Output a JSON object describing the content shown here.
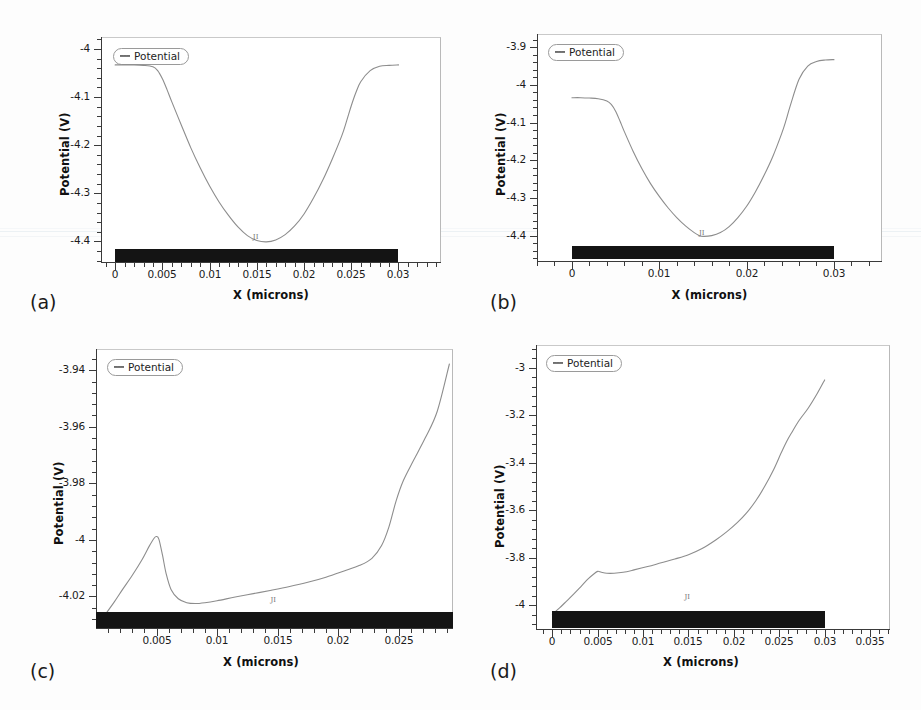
{
  "figure": {
    "background": "#fdfdfd",
    "curve_color": "#8d8d8d",
    "axis_color": "#3a3a3a",
    "device_bar_color": "#141414",
    "panel_count": 4
  },
  "panels": [
    {
      "caption": "(a)",
      "legend_label": "Potential",
      "xlabel": "X (microns)",
      "ylabel": "Potential (V)",
      "micromark": "JI",
      "x_ticks": [
        "0",
        "0.005",
        "0.01",
        "0.015",
        "0.02",
        "0.025",
        "0.03"
      ],
      "y_ticks": [
        "-4",
        "-4.1",
        "-4.2",
        "-4.3",
        "-4.4"
      ]
    },
    {
      "caption": "(b)",
      "legend_label": "Potential",
      "xlabel": "X (microns)",
      "ylabel": "Potential (V)",
      "micromark": "JI",
      "x_ticks": [
        "0",
        "0.01",
        "0.02",
        "0.03"
      ],
      "y_ticks": [
        "-3.9",
        "-4",
        "-4.1",
        "-4.2",
        "-4.3",
        "-4.4"
      ]
    },
    {
      "caption": "(c)",
      "legend_label": "Potential",
      "xlabel": "X (microns)",
      "ylabel": "Potential (V)",
      "micromark": "JI",
      "x_ticks": [
        "0.005",
        "0.01",
        "0.015",
        "0.02",
        "0.025"
      ],
      "y_ticks": [
        "-3.94",
        "-3.96",
        "-3.98",
        "-4",
        "-4.02"
      ]
    },
    {
      "caption": "(d)",
      "legend_label": "Potential",
      "xlabel": "X (microns)",
      "ylabel": "Potential (V)",
      "micromark": "JI",
      "x_ticks": [
        "0",
        "0.005",
        "0.01",
        "0.015",
        "0.02",
        "0.025",
        "0.03",
        "0.035"
      ],
      "y_ticks": [
        "-3",
        "-3.2",
        "-3.4",
        "-3.6",
        "-3.8",
        "-4"
      ]
    }
  ],
  "chart_data": [
    {
      "type": "line",
      "panel": "(a)",
      "title": "",
      "xlabel": "X (microns)",
      "ylabel": "Potential (V)",
      "legend": [
        "Potential"
      ],
      "legend_position": "top-left",
      "grid": false,
      "xlim": [
        -0.0015,
        0.0345
      ],
      "ylim": [
        -4.445,
        -3.975
      ],
      "x_ticks": [
        0,
        0.005,
        0.01,
        0.015,
        0.02,
        0.025,
        0.03
      ],
      "y_ticks": [
        -4,
        -4.1,
        -4.2,
        -4.3,
        -4.4
      ],
      "minor_ticks_per_interval": 4,
      "device_bar": {
        "x_start": 0,
        "x_end": 0.03,
        "label": "channel"
      },
      "series": [
        {
          "name": "Potential",
          "x": [
            0.0,
            0.001,
            0.002,
            0.003,
            0.004,
            0.0045,
            0.005,
            0.0055,
            0.006,
            0.007,
            0.008,
            0.009,
            0.01,
            0.011,
            0.012,
            0.013,
            0.014,
            0.015,
            0.016,
            0.017,
            0.018,
            0.019,
            0.02,
            0.021,
            0.022,
            0.023,
            0.024,
            0.0245,
            0.025,
            0.0255,
            0.026,
            0.027,
            0.028,
            0.029,
            0.03
          ],
          "y": [
            -4.033,
            -4.033,
            -4.033,
            -4.034,
            -4.037,
            -4.045,
            -4.062,
            -4.085,
            -4.11,
            -4.158,
            -4.205,
            -4.247,
            -4.285,
            -4.318,
            -4.346,
            -4.37,
            -4.388,
            -4.398,
            -4.401,
            -4.397,
            -4.386,
            -4.368,
            -4.343,
            -4.31,
            -4.272,
            -4.228,
            -4.18,
            -4.15,
            -4.118,
            -4.09,
            -4.068,
            -4.045,
            -4.036,
            -4.034,
            -4.033
          ]
        }
      ]
    },
    {
      "type": "line",
      "panel": "(b)",
      "title": "",
      "xlabel": "X (microns)",
      "ylabel": "Potential (V)",
      "legend": [
        "Potential"
      ],
      "legend_position": "top-left",
      "grid": false,
      "xlim": [
        -0.004,
        0.0355
      ],
      "ylim": [
        -4.47,
        -3.865
      ],
      "x_ticks": [
        0,
        0.01,
        0.02,
        0.03
      ],
      "y_ticks": [
        -3.9,
        -4,
        -4.1,
        -4.2,
        -4.3,
        -4.4
      ],
      "minor_ticks_per_interval": 4,
      "device_bar": {
        "x_start": 0,
        "x_end": 0.03,
        "label": "channel"
      },
      "series": [
        {
          "name": "Potential",
          "x": [
            0.0,
            0.001,
            0.002,
            0.003,
            0.004,
            0.0045,
            0.005,
            0.0055,
            0.006,
            0.007,
            0.008,
            0.009,
            0.01,
            0.011,
            0.012,
            0.013,
            0.014,
            0.0145,
            0.015,
            0.016,
            0.017,
            0.018,
            0.019,
            0.02,
            0.021,
            0.022,
            0.023,
            0.024,
            0.0245,
            0.025,
            0.026,
            0.027,
            0.028,
            0.029,
            0.03
          ],
          "y": [
            -4.034,
            -4.034,
            -4.035,
            -4.037,
            -4.043,
            -4.052,
            -4.07,
            -4.096,
            -4.124,
            -4.176,
            -4.222,
            -4.262,
            -4.296,
            -4.326,
            -4.352,
            -4.374,
            -4.392,
            -4.399,
            -4.402,
            -4.4,
            -4.392,
            -4.376,
            -4.352,
            -4.322,
            -4.284,
            -4.24,
            -4.19,
            -4.13,
            -4.095,
            -4.055,
            -3.985,
            -3.95,
            -3.938,
            -3.934,
            -3.933
          ]
        }
      ]
    },
    {
      "type": "line",
      "panel": "(c)",
      "title": "",
      "xlabel": "X (microns)",
      "ylabel": "Potential (V)",
      "legend": [
        "Potential"
      ],
      "legend_position": "top-left",
      "grid": false,
      "xlim": [
        0.0,
        0.0295
      ],
      "ylim": [
        -4.0315,
        -3.9325
      ],
      "x_ticks": [
        0.005,
        0.01,
        0.015,
        0.02,
        0.025
      ],
      "y_ticks": [
        -3.94,
        -3.96,
        -3.98,
        -4,
        -4.02
      ],
      "minor_ticks_per_interval": 4,
      "device_bar": {
        "x_start": 0.0,
        "x_end": 0.0295,
        "label": "channel"
      },
      "series": [
        {
          "name": "Potential",
          "x": [
            0.0002,
            0.0008,
            0.0015,
            0.0022,
            0.003,
            0.0038,
            0.0044,
            0.0048,
            0.005,
            0.0052,
            0.0055,
            0.0058,
            0.0062,
            0.0068,
            0.0075,
            0.0082,
            0.009,
            0.01,
            0.0115,
            0.013,
            0.0145,
            0.016,
            0.0175,
            0.019,
            0.0205,
            0.0218,
            0.0228,
            0.0236,
            0.0242,
            0.0248,
            0.0254,
            0.0262,
            0.0272,
            0.0282,
            0.0292
          ],
          "y": [
            -4.03,
            -4.0262,
            -4.022,
            -4.0175,
            -4.0125,
            -4.007,
            -4.0022,
            -3.9994,
            -3.9988,
            -3.9998,
            -4.0055,
            -4.012,
            -4.0175,
            -4.0208,
            -4.0222,
            -4.0225,
            -4.0222,
            -4.0215,
            -4.0202,
            -4.019,
            -4.0178,
            -4.0165,
            -4.015,
            -4.0132,
            -4.011,
            -4.009,
            -4.0065,
            -4.002,
            -3.9955,
            -3.9862,
            -3.979,
            -3.9722,
            -3.964,
            -3.9545,
            -3.9378
          ]
        }
      ]
    },
    {
      "type": "line",
      "panel": "(d)",
      "title": "",
      "xlabel": "X (microns)",
      "ylabel": "Potential (V)",
      "legend": [
        "Potential"
      ],
      "legend_position": "top-left",
      "grid": false,
      "xlim": [
        -0.0018,
        0.0372
      ],
      "ylim": [
        -4.105,
        -2.905
      ],
      "x_ticks": [
        0,
        0.005,
        0.01,
        0.015,
        0.02,
        0.025,
        0.03,
        0.035
      ],
      "y_ticks": [
        -3,
        -3.2,
        -3.4,
        -3.6,
        -3.8,
        -4
      ],
      "minor_ticks_per_interval": 4,
      "device_bar": {
        "x_start": 0,
        "x_end": 0.03,
        "label": "channel"
      },
      "series": [
        {
          "name": "Potential",
          "x": [
            0.0,
            0.0008,
            0.0016,
            0.0024,
            0.0032,
            0.004,
            0.0046,
            0.005,
            0.0054,
            0.006,
            0.0068,
            0.0078,
            0.009,
            0.0105,
            0.012,
            0.0135,
            0.015,
            0.0165,
            0.018,
            0.0192,
            0.0204,
            0.0214,
            0.0224,
            0.0234,
            0.0244,
            0.0252,
            0.0258,
            0.0264,
            0.0272,
            0.0282,
            0.0292,
            0.03
          ],
          "y": [
            -4.038,
            -4.012,
            -3.982,
            -3.952,
            -3.92,
            -3.888,
            -3.868,
            -3.858,
            -3.862,
            -3.866,
            -3.866,
            -3.862,
            -3.852,
            -3.838,
            -3.822,
            -3.806,
            -3.788,
            -3.762,
            -3.726,
            -3.692,
            -3.652,
            -3.612,
            -3.562,
            -3.5,
            -3.428,
            -3.36,
            -3.312,
            -3.272,
            -3.222,
            -3.17,
            -3.108,
            -3.052
          ]
        }
      ]
    }
  ]
}
